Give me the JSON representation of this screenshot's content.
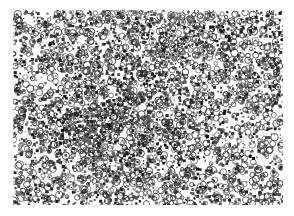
{
  "image": {
    "kind": "grayscale histology micrograph",
    "description": "Dense field of dark-stained cell nuclei with lighter circular cells and a few pale clear areas",
    "background_color": "#ffffff",
    "stain_color": "#1a1a1a",
    "frame": {
      "x": 13,
      "y": 10,
      "width": 270,
      "height": 195
    },
    "density_regions": [
      {
        "name": "dense-center-left",
        "cx": 0.35,
        "cy": 0.55,
        "r": 0.35,
        "density": 0.55
      },
      {
        "name": "dense-top",
        "cx": 0.6,
        "cy": 0.15,
        "r": 0.3,
        "density": 0.45
      },
      {
        "name": "sparse-right",
        "cx": 0.85,
        "cy": 0.6,
        "r": 0.3,
        "density": 0.22
      },
      {
        "name": "clear-left-gap",
        "cx": 0.1,
        "cy": 0.35,
        "r": 0.1,
        "density": 0.05
      },
      {
        "name": "clear-center-gap",
        "cx": 0.55,
        "cy": 0.7,
        "r": 0.06,
        "density": 0.08
      }
    ]
  }
}
